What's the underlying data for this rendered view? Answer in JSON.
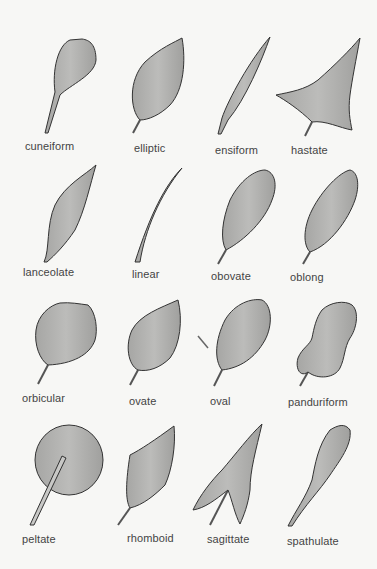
{
  "diagram": {
    "title": "",
    "colors": {
      "background": "#f7f7f5",
      "leaf_fill": "#a3a3a1",
      "leaf_light": "#bdbdbb",
      "leaf_stroke": "#333333",
      "label": "#444444"
    },
    "rows": [
      {
        "leaves": [
          {
            "label": "cuneiform"
          },
          {
            "label": "elliptic"
          },
          {
            "label": "ensiform"
          },
          {
            "label": "hastate"
          }
        ]
      },
      {
        "leaves": [
          {
            "label": "lanceolate"
          },
          {
            "label": "linear"
          },
          {
            "label": "obovate"
          },
          {
            "label": "oblong"
          }
        ]
      },
      {
        "leaves": [
          {
            "label": "orbicular"
          },
          {
            "label": "ovate"
          },
          {
            "label": "oval"
          },
          {
            "label": "panduriform"
          }
        ]
      },
      {
        "leaves": [
          {
            "label": "peltate"
          },
          {
            "label": "rhomboid"
          },
          {
            "label": "sagittate"
          },
          {
            "label": "spathulate"
          }
        ]
      }
    ]
  }
}
